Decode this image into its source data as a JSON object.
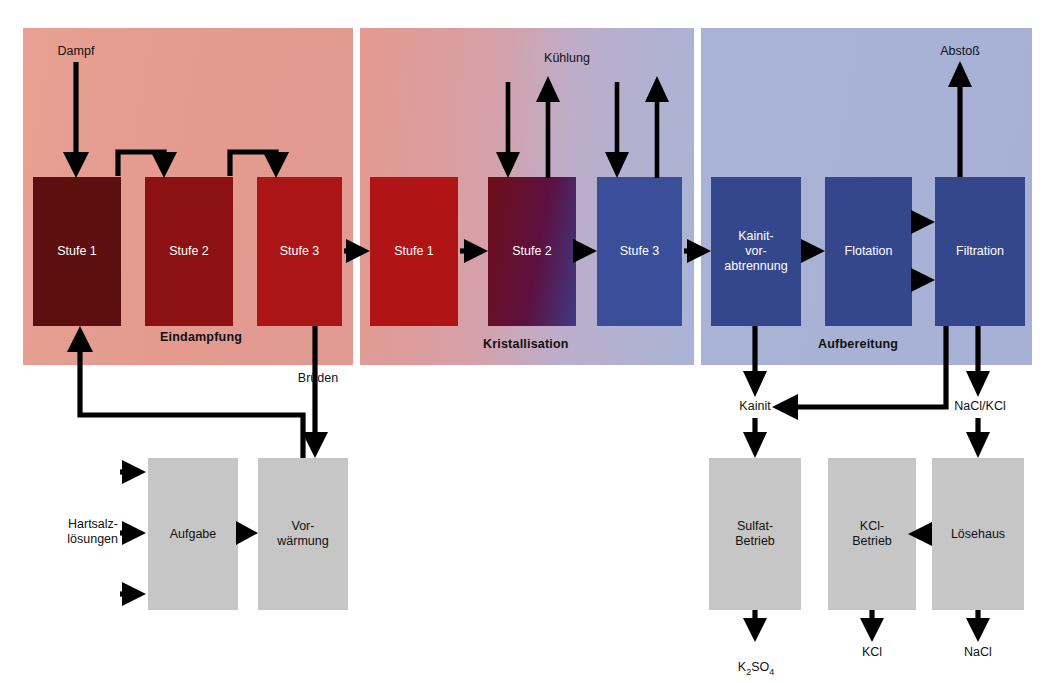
{
  "diagram": {
    "caption": ""
  },
  "panels": [
    {
      "id": "eindampfung",
      "label": "Eindampfung",
      "accent": "#e49a8f"
    },
    {
      "id": "kristallisation",
      "label": "Kristallisation",
      "accent": "#bcaecb"
    },
    {
      "id": "aufbereitung",
      "label": "Aufbereitung",
      "accent": "#a8b3d6"
    }
  ],
  "boxes": {
    "evaporation": [
      {
        "label": "Stufe 1",
        "color": "#5d0f10"
      },
      {
        "label": "Stufe 2",
        "color": "#8b1113"
      },
      {
        "label": "Stufe 3",
        "color": "#ac1515"
      }
    ],
    "crystallisation": [
      {
        "label": "Stufe 1",
        "color": "#b01414"
      },
      {
        "label": "Stufe 2",
        "color": "#5d1040"
      },
      {
        "label": "Stufe 3",
        "color": "#3a4e99"
      }
    ],
    "preparation": [
      {
        "label": "Kainit-\nvor-\nabtrennung",
        "color": "#35478c"
      },
      {
        "label": "Flotation",
        "color": "#35478c"
      },
      {
        "label": "Filtration",
        "color": "#35478c"
      }
    ],
    "feed": [
      {
        "label": "Aufgabe",
        "color": "#c6c6c6"
      },
      {
        "label": "Vor-\nwärmung",
        "color": "#c6c6c6"
      }
    ],
    "plants": [
      {
        "label": "Sulfat-\nBetrieb",
        "color": "#c6c6c6"
      },
      {
        "label": "KCl-\nBetrieb",
        "color": "#c6c6c6"
      },
      {
        "label": "Lösehaus",
        "color": "#c6c6c6"
      }
    ]
  },
  "stream_labels": {
    "dampf": "Dampf",
    "kuehlung": "Kühlung",
    "abstoss": "Abstoß",
    "brueden": "Brüden",
    "hartsalz": "Hartsalz-\nlösungen",
    "kainit": "Kainit",
    "naclkcl": "NaCl/KCl",
    "k2so4": "K",
    "k2so4_sub1": "2",
    "k2so4_mid": "SO",
    "k2so4_sub2": "4",
    "kcl": "KCl",
    "nacl": "NaCl"
  },
  "colors": {
    "arrow": "#000000",
    "box_gray": "#c6c6c6",
    "panel_warm": "#e49a8f",
    "panel_cool": "#a8b3d6",
    "text_light": "#ffffff",
    "text_dark": "#111111"
  }
}
